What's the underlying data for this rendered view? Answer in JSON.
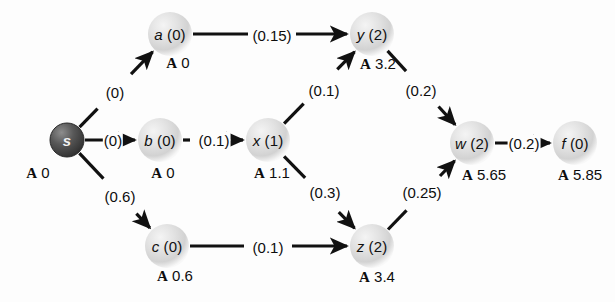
{
  "diagram": {
    "background": "#fdfdfd",
    "node_fill_light": "#dcdcdc",
    "node_fill_dark": "#4a4a4a",
    "edge_color": "#111111",
    "node_radius": 22,
    "source_radius": 17,
    "nodes": [
      {
        "id": "s",
        "name": "s",
        "paren": "",
        "display": "s",
        "dist_prefix": "A",
        "dist": "0",
        "x": 67,
        "y": 140,
        "type": "source",
        "label_dx": 0,
        "label_dy": 0,
        "dist_x": 38,
        "dist_y": 173
      },
      {
        "id": "a",
        "name": "a",
        "paren": "(0)",
        "display": "a (0)",
        "dist_prefix": "A",
        "dist": "0",
        "x": 170,
        "y": 34,
        "type": "normal",
        "label_dx": 0,
        "label_dy": 0,
        "dist_x": 178,
        "dist_y": 63
      },
      {
        "id": "b",
        "name": "b",
        "paren": "(0)",
        "display": "b (0)",
        "dist_prefix": "A",
        "dist": "0",
        "x": 160,
        "y": 140,
        "type": "normal",
        "label_dx": 0,
        "label_dy": 0,
        "dist_x": 163,
        "dist_y": 173
      },
      {
        "id": "c",
        "name": "c",
        "paren": "(0)",
        "display": "c (0)",
        "dist_prefix": "A",
        "dist": "0.6",
        "x": 167,
        "y": 246,
        "type": "normal",
        "label_dx": 0,
        "label_dy": 0,
        "dist_x": 175,
        "dist_y": 276
      },
      {
        "id": "x",
        "name": "x",
        "paren": "(1)",
        "display": "x (1)",
        "dist_prefix": "A",
        "dist": "1.1",
        "x": 268,
        "y": 140,
        "type": "normal",
        "label_dx": 0,
        "label_dy": 0,
        "dist_x": 272,
        "dist_y": 173
      },
      {
        "id": "y",
        "name": "y",
        "paren": "(2)",
        "display": "y (2)",
        "dist_prefix": "A",
        "dist": "3.2",
        "x": 372,
        "y": 34,
        "type": "normal",
        "label_dx": 0,
        "label_dy": 0,
        "dist_x": 378,
        "dist_y": 64
      },
      {
        "id": "z",
        "name": "z",
        "paren": "(2)",
        "display": "z (2)",
        "dist_prefix": "A",
        "dist": "3.4",
        "x": 372,
        "y": 246,
        "type": "normal",
        "label_dx": 0,
        "label_dy": 0,
        "dist_x": 377,
        "dist_y": 277
      },
      {
        "id": "w",
        "name": "w",
        "paren": "(2)",
        "display": "w (2)",
        "dist_prefix": "A",
        "dist": "5.65",
        "x": 472,
        "y": 143,
        "type": "normal",
        "label_dx": 0,
        "label_dy": 0,
        "dist_x": 484,
        "dist_y": 175
      },
      {
        "id": "f",
        "name": "f",
        "paren": "(0)",
        "display": "f (0)",
        "dist_prefix": "A",
        "dist": "5.85",
        "x": 575,
        "y": 143,
        "type": "normal",
        "label_dx": 0,
        "label_dy": 0,
        "dist_x": 580,
        "dist_y": 175
      }
    ],
    "edges": [
      {
        "id": "s-a",
        "from": "s",
        "to": "a",
        "weight": "(0)",
        "label_x": 115,
        "label_y": 92,
        "arrow": true,
        "style": "diagonal"
      },
      {
        "id": "s-b",
        "from": "s",
        "to": "b",
        "weight": "(0)",
        "label_x": 113,
        "label_y": 140,
        "arrow": true,
        "style": "straight"
      },
      {
        "id": "s-c",
        "from": "s",
        "to": "c",
        "weight": "(0.6)",
        "label_x": 120,
        "label_y": 196,
        "arrow": true,
        "style": "diagonal"
      },
      {
        "id": "a-y",
        "from": "a",
        "to": "y",
        "weight": "(0.15)",
        "label_x": 272,
        "label_y": 35,
        "arrow": true,
        "style": "straight"
      },
      {
        "id": "b-x",
        "from": "b",
        "to": "x",
        "weight": "(0.1)",
        "label_x": 214,
        "label_y": 140,
        "arrow": true,
        "style": "straight"
      },
      {
        "id": "x-y",
        "from": "x",
        "to": "y",
        "weight": "(0.1)",
        "label_x": 324,
        "label_y": 90,
        "arrow": true,
        "style": "diagonal"
      },
      {
        "id": "x-z",
        "from": "x",
        "to": "z",
        "weight": "(0.3)",
        "label_x": 325,
        "label_y": 192,
        "arrow": true,
        "style": "diagonal"
      },
      {
        "id": "c-z",
        "from": "c",
        "to": "z",
        "weight": "(0.1)",
        "label_x": 268,
        "label_y": 247,
        "arrow": true,
        "style": "straight"
      },
      {
        "id": "y-w",
        "from": "y",
        "to": "w",
        "weight": "(0.2)",
        "label_x": 421,
        "label_y": 90,
        "arrow": true,
        "style": "diagonal"
      },
      {
        "id": "z-w",
        "from": "z",
        "to": "w",
        "weight": "(0.25)",
        "label_x": 422,
        "label_y": 192,
        "arrow": true,
        "style": "diagonal"
      },
      {
        "id": "w-f",
        "from": "w",
        "to": "f",
        "weight": "(0.2)",
        "label_x": 524,
        "label_y": 143,
        "arrow": true,
        "style": "straight"
      }
    ]
  }
}
